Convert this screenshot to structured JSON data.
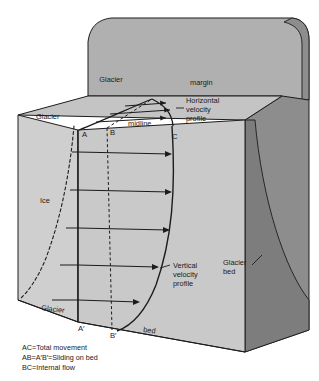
{
  "figure": {
    "colors": {
      "ice_front_face": "#c9c9c9",
      "ice_left_face": "#cfcfcf",
      "ice_top_face": "#c4c4c4",
      "valley_wall_back": "#b0b0b0",
      "valley_wall_right": "#8d8d8d",
      "valley_wall_right_dark": "#7d7d7d",
      "outline": "#1c1c1c",
      "text": "#1a1a1a",
      "background": "#ffffff"
    },
    "labels": {
      "glacier_top": "Glacier",
      "margin": "margin",
      "glacier_left": "Glacier",
      "glacier_lower_left": "Glacier",
      "ice": "Ice",
      "midline": "midline",
      "bed": "bed",
      "horizontal_velocity_profile": "Horizontal\nvelocity\nprofile",
      "horizontal_velocity_profile_lines": [
        "Horizontal",
        "velocity",
        "profile"
      ],
      "vertical_velocity_profile_lines": [
        "Vertical",
        "velocity",
        "profile"
      ],
      "glacier_bed_lines": [
        "Glacier",
        "bed"
      ]
    },
    "points": {
      "A": "A",
      "B": "B",
      "C": "C",
      "A_prime": "A′",
      "B_prime": "B′"
    },
    "legend": [
      "AC=Total movement",
      "AB=A′B′=Sliding on bed",
      "BC=Internal flow"
    ]
  }
}
